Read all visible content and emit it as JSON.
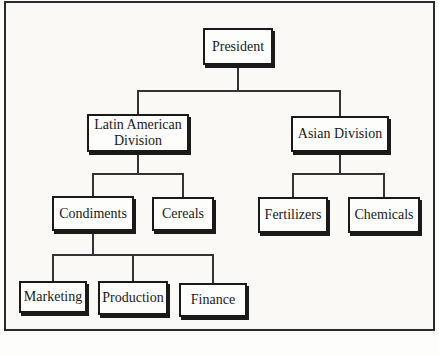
{
  "diagram": {
    "type": "organizational-chart",
    "nodes": {
      "president": {
        "label": "President"
      },
      "latin_american_division": {
        "label": "Latin American Division"
      },
      "asian_division": {
        "label": "Asian Division"
      },
      "condiments": {
        "label": "Condiments"
      },
      "cereals": {
        "label": "Cereals"
      },
      "fertilizers": {
        "label": "Fertilizers"
      },
      "chemicals": {
        "label": "Chemicals"
      },
      "marketing": {
        "label": "Marketing"
      },
      "production": {
        "label": "Production"
      },
      "finance": {
        "label": "Finance"
      }
    },
    "hierarchy": {
      "President": [
        "Latin American Division",
        "Asian Division"
      ],
      "Latin American Division": [
        "Condiments",
        "Cereals"
      ],
      "Asian Division": [
        "Fertilizers",
        "Chemicals"
      ],
      "Condiments": [
        "Marketing",
        "Production",
        "Finance"
      ]
    }
  },
  "colors": {
    "frame_border": "#2b2b2b",
    "box_border": "#1a1a1a",
    "connector": "#333333",
    "background": "#faf9f6",
    "box_background": "#fdfdfc",
    "text": "#1a1a1a"
  }
}
